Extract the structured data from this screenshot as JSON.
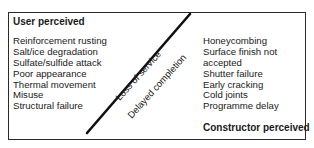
{
  "diagram": {
    "left_panel": {
      "heading": "User perceived",
      "items": [
        "Reinforcement rusting",
        "Salt/ice degradation",
        "Sulfate/sulfide attack",
        "Poor appearance",
        "Thermal movement",
        "Misuse",
        "Structural failure"
      ]
    },
    "right_panel": {
      "heading": "Constructor perceived",
      "items": [
        "Honeycombing",
        "Surface finish not",
        "accepted",
        "Shutter failure",
        "Early cracking",
        "Cold joints",
        "Programme delay"
      ]
    },
    "divider_labels": {
      "upper": "Loss of service",
      "lower": "Delayed completion"
    },
    "colors": {
      "line": "#111111",
      "border": "#2a2a2a",
      "text": "#1a1a1a"
    }
  }
}
